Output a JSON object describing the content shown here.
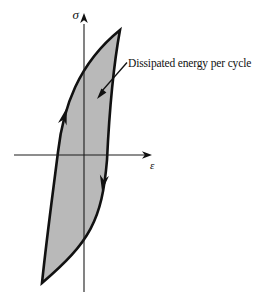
{
  "labels": {
    "y_axis": "σ",
    "x_axis": "ε",
    "annotation": "Dissipated energy per cycle"
  },
  "colors": {
    "background": "#ffffff",
    "ink": "#111111",
    "loop_fill": "#b9b9b9"
  },
  "shapes": {
    "loop_path": "M42,283 C47,235 53,192 58,152 C63,108 78,64 120,30 C113,68 109,118 107,160 C102,220 90,242 42,283 Z",
    "x_axis_path": "M14,155 H145",
    "y_axis_path": "M84,292 V24",
    "x_axis_arrowhead": "152,155 142,151.2 144.8,155 142,158.8",
    "y_axis_arrowhead": "84,13 80.2,23 84,20.2 87.8,23",
    "up_direction_arrow": "66.8,107.8 58,122.9 63.7,119.4 66.6,125.4",
    "down_direction_arrow": "102,191 99.9,174.5 103.7,180.1 108.9,175.9",
    "annotation_leader_path": "M127,62.5 L102,91",
    "annotation_arrowhead": "97,99 106.4,92.5 101.4,88.5"
  }
}
